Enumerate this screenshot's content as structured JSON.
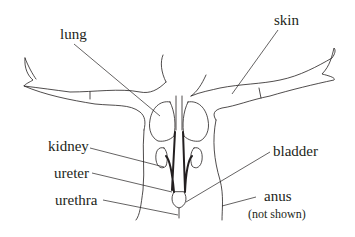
{
  "diagram": {
    "type": "anatomical-illustration",
    "colors": {
      "line": "#231f20",
      "background": "#ffffff"
    },
    "labels": [
      {
        "id": "lung",
        "text": "lung"
      },
      {
        "id": "skin",
        "text": "skin"
      },
      {
        "id": "kidney",
        "text": "kidney"
      },
      {
        "id": "ureter",
        "text": "ureter"
      },
      {
        "id": "urethra",
        "text": "urethra"
      },
      {
        "id": "bladder",
        "text": "bladder"
      },
      {
        "id": "anus",
        "text": "anus"
      },
      {
        "id": "anus_note",
        "text": "(not shown)"
      }
    ]
  }
}
